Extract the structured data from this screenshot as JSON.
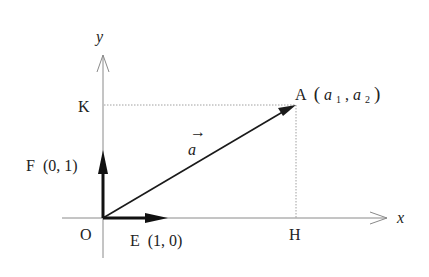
{
  "diagram": {
    "type": "vector-coordinate-diagram",
    "axes": {
      "x_label": "x",
      "y_label": "y"
    },
    "origin": {
      "label": "O"
    },
    "points": {
      "A": {
        "name": "A",
        "coords_open": "(",
        "coord1": "a",
        "coord1_sub": "1",
        "sep": ", ",
        "coord2": "a",
        "coord2_sub": "2",
        "coords_close": ")"
      },
      "K": {
        "name": "K"
      },
      "H": {
        "name": "H"
      },
      "E": {
        "name": "E",
        "coords": "(1, 0)"
      },
      "F": {
        "name": "F",
        "coords": "(0, 1)"
      }
    },
    "vector": {
      "label": "a",
      "arrow_mark": "→"
    },
    "colors": {
      "axis": "#8a8a8a",
      "vector": "#1a1a1a",
      "dotted": "#9a9a9a",
      "text": "#222222"
    }
  }
}
